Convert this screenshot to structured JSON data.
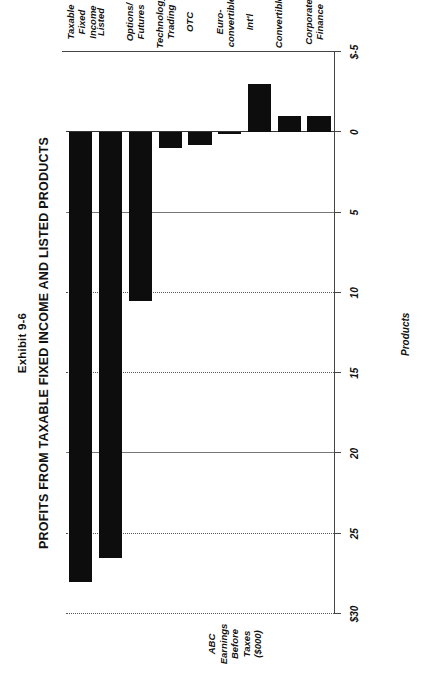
{
  "exhibit": {
    "number": "Exhibit 9-6",
    "title": "PROFITS FROM TAXABLE FIXED INCOME AND LISTED PRODUCTS"
  },
  "axes": {
    "value_axis_title": "ABC\nEarnings\nBefore\nTaxes\n($000)",
    "category_axis_title": "Products",
    "tick_labels": [
      "$30",
      "25",
      "20",
      "15",
      "10",
      "5",
      "0",
      "$-5"
    ],
    "tick_values": [
      30,
      25,
      20,
      15,
      10,
      5,
      0,
      -5
    ]
  },
  "chart_data": {
    "type": "bar",
    "orientation": "horizontal",
    "title": "PROFITS FROM TAXABLE FIXED INCOME AND LISTED PRODUCTS",
    "subtitle": "Exhibit 9-6",
    "xlabel": "Products",
    "ylabel": "ABC Earnings Before Taxes ($000)",
    "ylim": [
      -5,
      30
    ],
    "grid": true,
    "legend": "none",
    "bar_color": "#0d0d0d",
    "categories": [
      "Taxable\nFixed\nIncome",
      "Listed",
      "Options/\nFutures",
      "Technology\nTrading",
      "OTC",
      "Euro-\nconvertible",
      "Int'l",
      "Convertible",
      "Corporate\nFinance"
    ],
    "category_labels_flat": [
      "Taxable Fixed Income",
      "Listed",
      "Options/ Futures",
      "Technology Trading",
      "OTC",
      "Euro-convertible",
      "Int'l",
      "Convertible",
      "Corporate Finance"
    ],
    "values": [
      28,
      26.5,
      10.5,
      1,
      0.8,
      0.1,
      -3,
      -1,
      -1
    ]
  }
}
